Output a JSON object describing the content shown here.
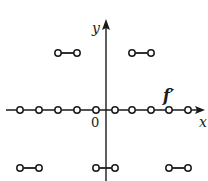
{
  "figure": {
    "type": "step-function-derivative-graph",
    "function_label": "f′",
    "axes": {
      "x_label": "x",
      "y_label": "y",
      "origin_label": "0"
    },
    "colors": {
      "ink": "#1a1a1a",
      "background": "#ffffff"
    },
    "segments": [
      {
        "name": "upper-left",
        "level": "positive",
        "x1": 58,
        "x2": 77,
        "y": 53,
        "endpoints": "open"
      },
      {
        "name": "upper-right",
        "level": "positive",
        "x1": 132,
        "x2": 151,
        "y": 53,
        "endpoints": "open"
      },
      {
        "name": "lower-left",
        "level": "negative",
        "x1": 20,
        "x2": 39,
        "y": 168,
        "endpoints": "open"
      },
      {
        "name": "lower-middle",
        "level": "negative",
        "x1": 96,
        "x2": 115,
        "y": 168,
        "endpoints": "open"
      },
      {
        "name": "lower-right",
        "level": "negative",
        "x1": 169,
        "x2": 188,
        "y": 168,
        "endpoints": "open"
      }
    ],
    "axis_open_points_x": [
      20,
      39,
      58,
      77,
      96,
      115,
      132,
      151,
      169,
      188
    ],
    "axis_zero_segments_note": "f′ = 0 on intervals along the x-axis, undefined at open-circle points"
  }
}
